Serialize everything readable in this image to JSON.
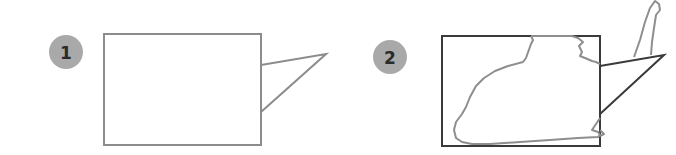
{
  "panels": [
    {
      "badge": "1",
      "description": "Empty rectangular frame with triangular callout"
    },
    {
      "badge": "2",
      "description": "Rectangular frame with irregular outline shape overflowing to a spike beyond the callout"
    }
  ],
  "colors": {
    "badge_fill": "#a9a9a9",
    "badge_text": "#2b2b2b",
    "frame_light": "#8c8c8c",
    "frame_dark": "#3a3a3a",
    "shape_stroke": "#8e8e8e"
  }
}
